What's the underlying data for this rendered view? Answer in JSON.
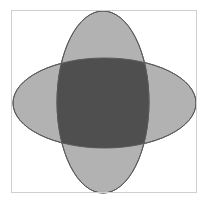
{
  "figure": {
    "title": "",
    "background_color": "#ffffff",
    "frame": {
      "name": "plot-border",
      "x": 11,
      "y": 10,
      "width": 186,
      "height": 183,
      "stroke_color": "#cfcfcf",
      "stroke_width": 1,
      "fill": "none"
    }
  },
  "chart_data": {
    "type": "diagram",
    "subtype": "two-set-venn-ellipses",
    "title": "",
    "xlabel": "",
    "ylabel": "",
    "grid": false,
    "legend": null,
    "canvas": {
      "width": 209,
      "height": 203
    },
    "colors": {
      "set_fill": "#b2b2b2",
      "intersection_fill": "#4f4f4f",
      "outline": "#5a5a5a",
      "background": "#ffffff",
      "frame": "#cfcfcf"
    },
    "opacity": 1,
    "shapes": [
      {
        "name": "horizontal-ellipse",
        "label": "",
        "cx": 104.5,
        "cy": 103,
        "rx": 91.5,
        "ry": 45,
        "rotation": 0,
        "fill": "#b2b2b2",
        "stroke": "#5a5a5a",
        "stroke_width": 1
      },
      {
        "name": "vertical-ellipse",
        "label": "",
        "cx": 103,
        "cy": 102,
        "rx": 46,
        "ry": 91,
        "rotation": 0,
        "fill": "#b2b2b2",
        "stroke": "#5a5a5a",
        "stroke_width": 1
      }
    ],
    "intersection": {
      "name": "intersection-region",
      "label": "",
      "fill": "#4f4f4f",
      "description": "lens region where the horizontal and vertical ellipses overlap"
    }
  }
}
